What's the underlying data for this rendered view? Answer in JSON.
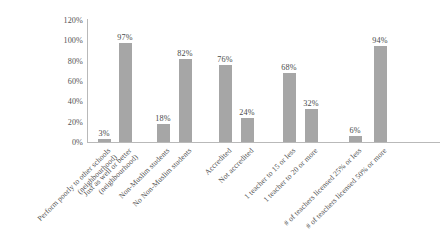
{
  "chart_data": {
    "type": "bar",
    "title": "",
    "xlabel": "",
    "ylabel": "",
    "ylim": [
      0,
      120
    ],
    "grid": false,
    "legend": false,
    "bar_color": "#a6a6a6",
    "axis_color": "#b9b9b9",
    "ytick_labels": [
      "120%",
      "100%",
      "80%",
      "60%",
      "40%",
      "20%",
      "0%"
    ],
    "ytick_values": [
      120,
      100,
      80,
      60,
      40,
      20,
      0
    ],
    "categories": [
      "Perform poorly to other schools (neighbourhood)",
      "Just as well or better (neighbourhood)",
      "Non-Muslim students",
      "No Non-Muslim students",
      "Accredited",
      "Not accredited",
      "1 teacher to 15 or less",
      "1 teacher to 20 or more",
      "# of teachers licensed 25% or less",
      "# of teachers licensed 50% or more"
    ],
    "category_lines": [
      [
        "Perform poorly to other schools",
        "(neighbourhood)"
      ],
      [
        "Just as well or better",
        "(neighbourhood)"
      ],
      [
        "Non-Muslim students",
        ""
      ],
      [
        "No Non-Muslim students",
        ""
      ],
      [
        "Accredited",
        ""
      ],
      [
        "Not accredited",
        ""
      ],
      [
        "1 teacher to 15 or less",
        ""
      ],
      [
        "1 teacher to 20 or more",
        ""
      ],
      [
        "# of teachers licensed 25% or less",
        ""
      ],
      [
        "# of teachers licensed 50% or more",
        ""
      ]
    ],
    "values": [
      3,
      97,
      18,
      82,
      76,
      24,
      68,
      32,
      6,
      94
    ],
    "value_labels": [
      "3%",
      "97%",
      "18%",
      "82%",
      "76%",
      "24%",
      "68%",
      "32%",
      "6%",
      "94%"
    ]
  }
}
